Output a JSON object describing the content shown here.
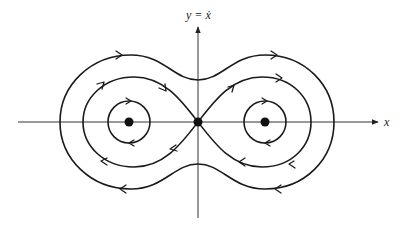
{
  "diagram": {
    "type": "phase-portrait",
    "axes": {
      "x_label": "x",
      "y_label": "y = ẋ"
    },
    "fixed_points": [
      {
        "name": "left-center",
        "kind": "center",
        "marker": "filled-dot"
      },
      {
        "name": "saddle",
        "kind": "saddle",
        "marker": "filled-dot",
        "location": "origin"
      },
      {
        "name": "right-center",
        "kind": "center",
        "marker": "filled-dot"
      }
    ],
    "trajectories": [
      {
        "name": "left-small-orbit",
        "kind": "closed orbit around left center",
        "direction": "clockwise"
      },
      {
        "name": "right-small-orbit",
        "kind": "closed orbit around right center",
        "direction": "clockwise"
      },
      {
        "name": "homoclinic-figure-eight",
        "kind": "separatrix loops through saddle",
        "direction": "clockwise on each lobe"
      },
      {
        "name": "outer-orbit",
        "kind": "closed orbit enclosing both wells (peanut shape)",
        "direction": "clockwise"
      }
    ],
    "colors": {
      "stroke": "#1a1a1a",
      "axis": "#333333",
      "background": "#ffffff"
    }
  }
}
